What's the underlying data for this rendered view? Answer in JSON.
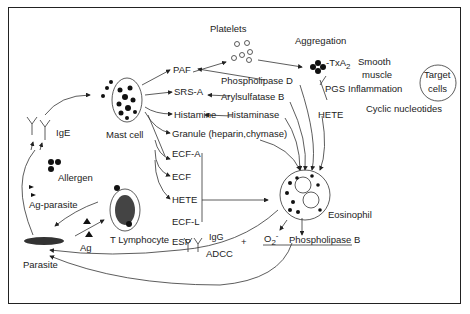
{
  "diagram": {
    "nodes": {
      "mast_cell": "Mast cell",
      "ige": "IgE",
      "allergen": "Allergen",
      "ag_parasite": "Ag-parasite",
      "parasite": "Parasite",
      "ag": "Ag",
      "t_lymphocyte": "T Lymphocyte",
      "igg": "IgG",
      "adcc": "ADCC",
      "plus": "+",
      "eosinophil": "Eosinophil",
      "o2": "O",
      "o2_sub": "2",
      "o2_sup": "-",
      "phospholipase_b": "Phospholipase B",
      "platelets": "Platelets",
      "aggregation": "Aggregation",
      "txa": "-TxA",
      "txa_sub": "2",
      "smooth_muscle_1": "Smooth",
      "smooth_muscle_2": "muscle",
      "pgs": "PGS",
      "inflammation": "Inflammation",
      "hete_top": "HETE",
      "target_cells_1": "Target",
      "target_cells_2": "cells",
      "cyclic_nucleotides": "Cyclic nucleotides"
    },
    "mediators": [
      {
        "label": "PAF"
      },
      {
        "label": "SRS-A"
      },
      {
        "label": "Histamine"
      },
      {
        "label": "Granule (heparin,chymase)"
      },
      {
        "label": "ECF-A"
      },
      {
        "label": "ECF"
      },
      {
        "label": "HETE"
      },
      {
        "label": "ECF-L"
      },
      {
        "label": "ESP"
      }
    ],
    "eosinophil_enzymes": [
      {
        "label": "Phospholipase D"
      },
      {
        "label": "Arylsulfatase B"
      },
      {
        "label": "Histaminase"
      }
    ]
  }
}
